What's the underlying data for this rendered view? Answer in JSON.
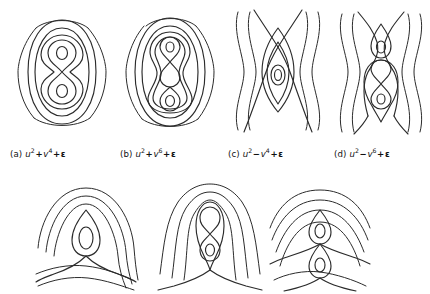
{
  "figure": {
    "background_color": "#ffffff",
    "stroke_color": "#2b2b2b",
    "rows": 2,
    "top_row_panel_count": 4,
    "bottom_row_panel_count": 3
  },
  "captions": [
    {
      "key": "a",
      "label": "(a)",
      "var1": "u",
      "exp1": "2",
      "operator": "+",
      "var2": "v",
      "exp2": "4",
      "tail": "+",
      "epsilon": "ε",
      "text": "(a) u2+v4+ε"
    },
    {
      "key": "b",
      "label": "(b)",
      "var1": "u",
      "exp1": "2",
      "operator": "+",
      "var2": "v",
      "exp2": "6",
      "tail": "+",
      "epsilon": "ε",
      "text": "(b) u2+v6+ε"
    },
    {
      "key": "c",
      "label": "(c)",
      "var1": "u",
      "exp1": "2",
      "operator": "−",
      "var2": "v",
      "exp2": "4",
      "tail": "+",
      "epsilon": "ε",
      "text": "(c) u2−v4+ε"
    },
    {
      "key": "d",
      "label": "(d)",
      "var1": "u",
      "exp1": "2",
      "operator": "−",
      "var2": "v",
      "exp2": "6",
      "tail": "+",
      "epsilon": "ε",
      "text": "(d) u2−v6+ε"
    }
  ],
  "panels": {
    "top": [
      {
        "key": "a",
        "name": "contour-panel-a",
        "description": "Nested closed oval contours enclosing a figure-eight with two small interior ovals",
        "outer_arcs": 2,
        "closed_ovals": 2,
        "lemniscate_lobes": 2,
        "inner_ovals": 2
      },
      {
        "key": "b",
        "name": "contour-panel-b",
        "description": "Nested closed oval contours enclosing a double figure-eight with three lobes",
        "outer_arcs": 2,
        "closed_ovals": 2,
        "lemniscate_lobes": 3,
        "inner_ovals": 1
      },
      {
        "key": "c",
        "name": "contour-panel-c",
        "description": "Saddle-type contours with crossing X curves and one central oval",
        "side_waves": 4,
        "crossings": 1,
        "inner_ovals": 2
      },
      {
        "key": "d",
        "name": "contour-panel-d",
        "description": "Saddle-type contours with two crossings enclosing an oval and a figure-eight",
        "side_waves": 4,
        "crossings": 2,
        "inner_ovals": 3
      }
    ],
    "bottom": [
      {
        "key": "e",
        "name": "contour-panel-e",
        "description": "Arched contours with single central oval above an X crossing",
        "arcs": 3,
        "crossings": 1,
        "inner_ovals": 1
      },
      {
        "key": "f",
        "name": "contour-panel-f",
        "description": "Arched contours enclosing a figure-eight above an X crossing",
        "arcs": 3,
        "crossings": 1,
        "lemniscate_lobes": 2
      },
      {
        "key": "g",
        "name": "contour-panel-g",
        "description": "Arched contours with two stacked teardrop ovals and two crossings",
        "arcs": 4,
        "crossings": 2,
        "inner_ovals": 2
      }
    ]
  }
}
